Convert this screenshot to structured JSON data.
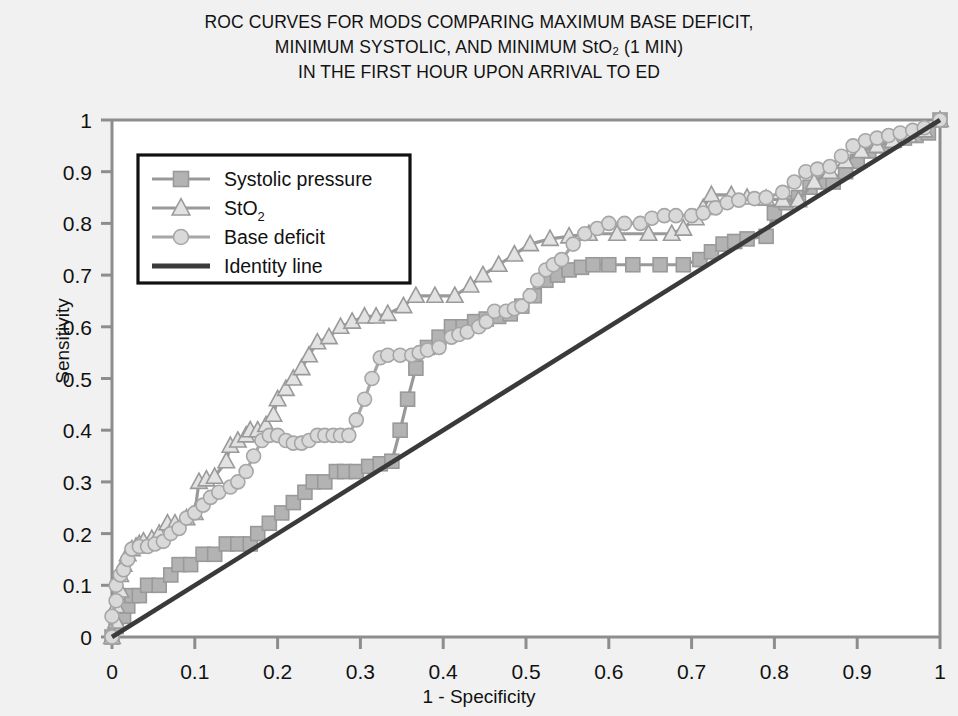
{
  "figure": {
    "title_lines": [
      "ROC CURVES FOR MODS COMPARING MAXIMUM BASE DEFICIT,",
      "MINIMUM SYSTOLIC, AND MINIMUM StO₂ (1 MIN)",
      "IN THE FIRST HOUR UPON ARRIVAL TO ED"
    ],
    "background_color": "#f1f1f1",
    "plot_background_color": "#ffffff"
  },
  "chart_data": {
    "type": "line",
    "xlabel": "1 - Specificity",
    "ylabel": "Sensitivity",
    "xlim": [
      0,
      1
    ],
    "ylim": [
      0,
      1
    ],
    "xticks": [
      "0",
      "0.1",
      "0.2",
      "0.3",
      "0.4",
      "0.5",
      "0.6",
      "0.7",
      "0.8",
      "0.9",
      "1"
    ],
    "yticks": [
      "0",
      "0.1",
      "0.2",
      "0.3",
      "0.4",
      "0.5",
      "0.6",
      "0.7",
      "0.8",
      "0.9",
      "1"
    ],
    "grid": false,
    "legend_position": "upper-left-inside",
    "series": [
      {
        "name": "Systolic pressure",
        "marker": "square",
        "color": "#999999",
        "marker_fill": "#b3b3b3",
        "points": [
          [
            0.0,
            0.0
          ],
          [
            0.005,
            0.02
          ],
          [
            0.01,
            0.04
          ],
          [
            0.014,
            0.04
          ],
          [
            0.019,
            0.06
          ],
          [
            0.024,
            0.08
          ],
          [
            0.033,
            0.08
          ],
          [
            0.043,
            0.1
          ],
          [
            0.057,
            0.1
          ],
          [
            0.071,
            0.12
          ],
          [
            0.081,
            0.14
          ],
          [
            0.095,
            0.14
          ],
          [
            0.11,
            0.16
          ],
          [
            0.124,
            0.16
          ],
          [
            0.138,
            0.18
          ],
          [
            0.152,
            0.18
          ],
          [
            0.167,
            0.18
          ],
          [
            0.176,
            0.2
          ],
          [
            0.19,
            0.22
          ],
          [
            0.205,
            0.24
          ],
          [
            0.219,
            0.26
          ],
          [
            0.233,
            0.28
          ],
          [
            0.243,
            0.3
          ],
          [
            0.257,
            0.3
          ],
          [
            0.271,
            0.32
          ],
          [
            0.281,
            0.32
          ],
          [
            0.295,
            0.32
          ],
          [
            0.31,
            0.33
          ],
          [
            0.324,
            0.335
          ],
          [
            0.338,
            0.34
          ],
          [
            0.348,
            0.4
          ],
          [
            0.357,
            0.46
          ],
          [
            0.367,
            0.52
          ],
          [
            0.381,
            0.56
          ],
          [
            0.395,
            0.58
          ],
          [
            0.41,
            0.6
          ],
          [
            0.424,
            0.6
          ],
          [
            0.438,
            0.61
          ],
          [
            0.452,
            0.615
          ],
          [
            0.467,
            0.62
          ],
          [
            0.481,
            0.625
          ],
          [
            0.495,
            0.64
          ],
          [
            0.51,
            0.66
          ],
          [
            0.524,
            0.69
          ],
          [
            0.538,
            0.7
          ],
          [
            0.552,
            0.71
          ],
          [
            0.567,
            0.715
          ],
          [
            0.581,
            0.72
          ],
          [
            0.6,
            0.72
          ],
          [
            0.629,
            0.72
          ],
          [
            0.662,
            0.72
          ],
          [
            0.69,
            0.72
          ],
          [
            0.71,
            0.73
          ],
          [
            0.724,
            0.745
          ],
          [
            0.738,
            0.76
          ],
          [
            0.752,
            0.765
          ],
          [
            0.767,
            0.77
          ],
          [
            0.79,
            0.775
          ],
          [
            0.8,
            0.82
          ],
          [
            0.814,
            0.84
          ],
          [
            0.829,
            0.85
          ],
          [
            0.843,
            0.87
          ],
          [
            0.857,
            0.88
          ],
          [
            0.871,
            0.88
          ],
          [
            0.886,
            0.9
          ],
          [
            0.9,
            0.92
          ],
          [
            0.914,
            0.94
          ],
          [
            0.929,
            0.95
          ],
          [
            0.943,
            0.96
          ],
          [
            0.957,
            0.965
          ],
          [
            0.971,
            0.97
          ],
          [
            0.986,
            0.975
          ],
          [
            1.0,
            1.0
          ]
        ]
      },
      {
        "name": "StO2",
        "marker": "triangle",
        "color": "#9a9a9a",
        "marker_fill": "#e2e2e2",
        "points": [
          [
            0.0,
            0.0
          ],
          [
            0.005,
            0.03
          ],
          [
            0.005,
            0.06
          ],
          [
            0.01,
            0.09
          ],
          [
            0.01,
            0.12
          ],
          [
            0.014,
            0.14
          ],
          [
            0.019,
            0.16
          ],
          [
            0.024,
            0.17
          ],
          [
            0.029,
            0.175
          ],
          [
            0.033,
            0.18
          ],
          [
            0.038,
            0.185
          ],
          [
            0.048,
            0.19
          ],
          [
            0.057,
            0.2
          ],
          [
            0.067,
            0.22
          ],
          [
            0.076,
            0.22
          ],
          [
            0.09,
            0.23
          ],
          [
            0.1,
            0.24
          ],
          [
            0.105,
            0.3
          ],
          [
            0.114,
            0.305
          ],
          [
            0.124,
            0.31
          ],
          [
            0.138,
            0.34
          ],
          [
            0.143,
            0.37
          ],
          [
            0.152,
            0.38
          ],
          [
            0.162,
            0.39
          ],
          [
            0.167,
            0.4
          ],
          [
            0.176,
            0.4
          ],
          [
            0.186,
            0.41
          ],
          [
            0.195,
            0.43
          ],
          [
            0.2,
            0.46
          ],
          [
            0.21,
            0.48
          ],
          [
            0.219,
            0.5
          ],
          [
            0.229,
            0.52
          ],
          [
            0.238,
            0.545
          ],
          [
            0.248,
            0.57
          ],
          [
            0.262,
            0.58
          ],
          [
            0.276,
            0.6
          ],
          [
            0.29,
            0.61
          ],
          [
            0.305,
            0.62
          ],
          [
            0.319,
            0.62
          ],
          [
            0.333,
            0.625
          ],
          [
            0.352,
            0.64
          ],
          [
            0.367,
            0.66
          ],
          [
            0.39,
            0.66
          ],
          [
            0.414,
            0.66
          ],
          [
            0.433,
            0.68
          ],
          [
            0.448,
            0.7
          ],
          [
            0.467,
            0.72
          ],
          [
            0.486,
            0.74
          ],
          [
            0.505,
            0.76
          ],
          [
            0.529,
            0.77
          ],
          [
            0.552,
            0.775
          ],
          [
            0.576,
            0.78
          ],
          [
            0.61,
            0.78
          ],
          [
            0.648,
            0.78
          ],
          [
            0.676,
            0.78
          ],
          [
            0.69,
            0.79
          ],
          [
            0.705,
            0.81
          ],
          [
            0.714,
            0.83
          ],
          [
            0.724,
            0.855
          ],
          [
            0.748,
            0.855
          ],
          [
            0.767,
            0.85
          ],
          [
            0.79,
            0.848
          ],
          [
            0.81,
            0.845
          ],
          [
            0.829,
            0.845
          ],
          [
            0.848,
            0.88
          ],
          [
            0.867,
            0.9
          ],
          [
            0.886,
            0.92
          ],
          [
            0.905,
            0.94
          ],
          [
            0.924,
            0.95
          ],
          [
            0.943,
            0.96
          ],
          [
            0.962,
            0.97
          ],
          [
            0.981,
            0.98
          ],
          [
            1.0,
            1.0
          ]
        ]
      },
      {
        "name": "Base deficit",
        "marker": "circle",
        "color": "#a6a6a6",
        "marker_fill": "#d9d9d9",
        "points": [
          [
            0.0,
            0.0
          ],
          [
            0.0,
            0.04
          ],
          [
            0.005,
            0.07
          ],
          [
            0.005,
            0.1
          ],
          [
            0.01,
            0.12
          ],
          [
            0.014,
            0.13
          ],
          [
            0.019,
            0.15
          ],
          [
            0.024,
            0.17
          ],
          [
            0.033,
            0.175
          ],
          [
            0.043,
            0.175
          ],
          [
            0.052,
            0.18
          ],
          [
            0.062,
            0.185
          ],
          [
            0.071,
            0.2
          ],
          [
            0.081,
            0.21
          ],
          [
            0.09,
            0.23
          ],
          [
            0.1,
            0.24
          ],
          [
            0.11,
            0.255
          ],
          [
            0.119,
            0.27
          ],
          [
            0.129,
            0.28
          ],
          [
            0.143,
            0.29
          ],
          [
            0.152,
            0.3
          ],
          [
            0.162,
            0.32
          ],
          [
            0.171,
            0.35
          ],
          [
            0.181,
            0.38
          ],
          [
            0.19,
            0.39
          ],
          [
            0.2,
            0.39
          ],
          [
            0.21,
            0.38
          ],
          [
            0.219,
            0.375
          ],
          [
            0.229,
            0.375
          ],
          [
            0.238,
            0.38
          ],
          [
            0.248,
            0.39
          ],
          [
            0.257,
            0.39
          ],
          [
            0.267,
            0.39
          ],
          [
            0.276,
            0.39
          ],
          [
            0.286,
            0.39
          ],
          [
            0.295,
            0.42
          ],
          [
            0.305,
            0.46
          ],
          [
            0.314,
            0.5
          ],
          [
            0.324,
            0.54
          ],
          [
            0.333,
            0.545
          ],
          [
            0.348,
            0.545
          ],
          [
            0.362,
            0.545
          ],
          [
            0.371,
            0.55
          ],
          [
            0.381,
            0.555
          ],
          [
            0.395,
            0.56
          ],
          [
            0.41,
            0.58
          ],
          [
            0.419,
            0.585
          ],
          [
            0.429,
            0.59
          ],
          [
            0.443,
            0.6
          ],
          [
            0.452,
            0.61
          ],
          [
            0.462,
            0.63
          ],
          [
            0.476,
            0.63
          ],
          [
            0.486,
            0.635
          ],
          [
            0.495,
            0.64
          ],
          [
            0.505,
            0.66
          ],
          [
            0.514,
            0.69
          ],
          [
            0.524,
            0.71
          ],
          [
            0.533,
            0.72
          ],
          [
            0.543,
            0.73
          ],
          [
            0.557,
            0.76
          ],
          [
            0.571,
            0.78
          ],
          [
            0.586,
            0.79
          ],
          [
            0.6,
            0.8
          ],
          [
            0.619,
            0.8
          ],
          [
            0.638,
            0.8
          ],
          [
            0.652,
            0.81
          ],
          [
            0.667,
            0.815
          ],
          [
            0.681,
            0.815
          ],
          [
            0.7,
            0.815
          ],
          [
            0.714,
            0.82
          ],
          [
            0.729,
            0.83
          ],
          [
            0.743,
            0.84
          ],
          [
            0.757,
            0.845
          ],
          [
            0.776,
            0.848
          ],
          [
            0.79,
            0.85
          ],
          [
            0.81,
            0.86
          ],
          [
            0.824,
            0.88
          ],
          [
            0.838,
            0.9
          ],
          [
            0.852,
            0.905
          ],
          [
            0.867,
            0.91
          ],
          [
            0.881,
            0.93
          ],
          [
            0.895,
            0.95
          ],
          [
            0.91,
            0.96
          ],
          [
            0.924,
            0.965
          ],
          [
            0.938,
            0.97
          ],
          [
            0.952,
            0.975
          ],
          [
            0.967,
            0.98
          ],
          [
            0.981,
            0.985
          ],
          [
            1.0,
            1.0
          ]
        ]
      },
      {
        "name": "Identity line",
        "marker": "none",
        "color": "#3a3a3a",
        "marker_fill": "#3a3a3a",
        "points": [
          [
            0.0,
            0.0
          ],
          [
            1.0,
            1.0
          ]
        ]
      }
    ]
  },
  "legend": {
    "entries": [
      {
        "label": "Systolic pressure",
        "marker": "square",
        "color": "#999999",
        "marker_fill": "#b3b3b3"
      },
      {
        "label": "StO",
        "sub": "2",
        "marker": "triangle",
        "color": "#9a9a9a",
        "marker_fill": "#e2e2e2"
      },
      {
        "label": "Base deficit",
        "marker": "circle",
        "color": "#a6a6a6",
        "marker_fill": "#d9d9d9"
      },
      {
        "label": "Identity line",
        "marker": "none",
        "color": "#3a3a3a",
        "marker_fill": "#3a3a3a"
      }
    ]
  }
}
